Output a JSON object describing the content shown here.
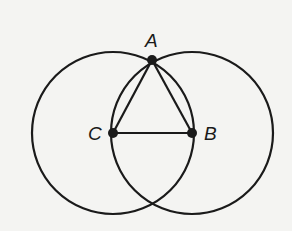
{
  "diagram": {
    "stroke_color": "#1a1a1a",
    "background": "#f4f4f2",
    "points": {
      "A": {
        "label": "A",
        "x": 152,
        "y": 60
      },
      "B": {
        "label": "B",
        "x": 192,
        "y": 133
      },
      "C": {
        "label": "C",
        "x": 113,
        "y": 133
      }
    },
    "circles": [
      {
        "name": "circle-centered-C",
        "cx": 113,
        "cy": 133,
        "r": 81
      },
      {
        "name": "circle-centered-B",
        "cx": 192,
        "cy": 133,
        "r": 81
      }
    ],
    "segments": [
      "AC",
      "AB",
      "CB"
    ]
  }
}
